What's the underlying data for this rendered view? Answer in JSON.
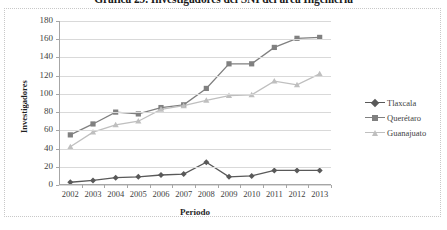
{
  "chart_data": {
    "type": "line",
    "title": "Gráfica 29. Investigadores del SNI del área Ingeniería",
    "xlabel": "Periodo",
    "ylabel": "Investigadores",
    "categories": [
      "2002",
      "2003",
      "2004",
      "2005",
      "2006",
      "2007",
      "2008",
      "2009",
      "2010",
      "2011",
      "2012",
      "2013"
    ],
    "ylim": [
      0,
      180
    ],
    "ytick_step": 20,
    "yticks": [
      "0",
      "20",
      "40",
      "60",
      "80",
      "100",
      "120",
      "140",
      "160",
      "180"
    ],
    "grid": true,
    "legend_position": "right",
    "series": [
      {
        "name": "Tlaxcala",
        "color": "#595959",
        "marker": "diamond",
        "values": [
          3,
          5,
          8,
          9,
          11,
          12,
          25,
          9,
          10,
          16,
          16,
          16
        ]
      },
      {
        "name": "Querétaro",
        "color": "#808080",
        "marker": "square",
        "values": [
          55,
          67,
          80,
          78,
          85,
          88,
          106,
          133,
          133,
          151,
          161,
          162
        ]
      },
      {
        "name": "Guanajuato",
        "color": "#bfbfbf",
        "marker": "triangle",
        "values": [
          42,
          58,
          66,
          70,
          83,
          87,
          93,
          98,
          99,
          114,
          110,
          122
        ]
      }
    ]
  },
  "legend": {
    "items": [
      {
        "label": "Tlaxcala"
      },
      {
        "label": "Querétaro"
      },
      {
        "label": "Guanajuato"
      }
    ]
  },
  "colors": {
    "series_1": "#595959",
    "series_2": "#808080",
    "series_3": "#bfbfbf",
    "gridline": "#d9d9d9",
    "axis": "#a6a6a6",
    "border": "#c8c8c8",
    "background": "#ffffff",
    "text": "#3f3f3f"
  }
}
